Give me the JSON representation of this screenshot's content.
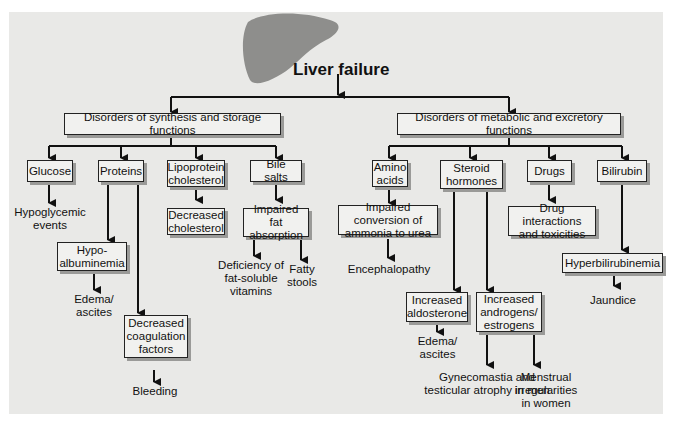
{
  "title": "Liver failure",
  "branches": {
    "left": {
      "label": "Disorders of synthesis and storage functions",
      "glucose": {
        "label": "Glucose",
        "effect": "Hypoglycemic events"
      },
      "proteins": {
        "label": "Proteins",
        "hypo": "Hypo-albuminemia",
        "hypo_l1": "Hypo-",
        "hypo_l2": "albuminemia",
        "hypo_effect": "Edema/ ascites",
        "coag": "Decreased coagulation factors",
        "coag_effect": "Bleeding"
      },
      "lipo": {
        "label": "Lipoprotein cholesterol",
        "effect": "Decreased cholesterol"
      },
      "bile": {
        "label": "Bile salts",
        "effect": "Impaired fat absorption",
        "sub1": "Deficiency of fat-soluble vitamins",
        "sub2": "Fatty stools"
      }
    },
    "right": {
      "label": "Disorders of metabolic and excretory functions",
      "amino": {
        "label": "Amino acids",
        "effect": "Impaired conversion of ammonia to urea",
        "sub": "Encephalopathy"
      },
      "steroid": {
        "label": "Steroid hormones",
        "aldo": "Increased aldosterone",
        "aldo_effect": "Edema/ ascites",
        "andro": "Increased androgens/ estrogens",
        "andro_effect1": "Gynecomastia and testicular atrophy in men",
        "andro_effect2": "Menstrual irregularities in women"
      },
      "drugs": {
        "label": "Drugs",
        "effect": "Drug interactions and toxicities"
      },
      "bilirubin": {
        "label": "Bilirubin",
        "effect": "Hyperbilirubinemia",
        "sub": "Jaundice"
      }
    }
  }
}
